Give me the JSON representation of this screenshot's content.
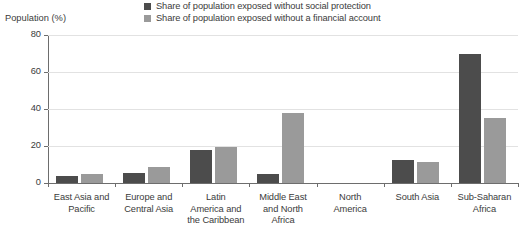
{
  "axis_title": "Population (%)",
  "legend": {
    "items": [
      {
        "label": "Share of population exposed without social protection",
        "color": "#4c4c4c",
        "swatch_name": "legend-swatch-social-protection"
      },
      {
        "label": "Share of population exposed without a financial account",
        "color": "#9a9a9a",
        "swatch_name": "legend-swatch-financial-account"
      }
    ]
  },
  "chart_data": {
    "type": "bar",
    "title": "",
    "subtitle": "",
    "xlabel": "",
    "ylabel": "Population (%)",
    "ylim": [
      0,
      80
    ],
    "yticks": [
      0,
      20,
      40,
      60,
      80
    ],
    "ytick_labels": [
      "0",
      "20",
      "40",
      "60",
      "80"
    ],
    "grid": true,
    "legend_position": "top",
    "categories": [
      "East Asia and Pacific",
      "Europe and Central Asia",
      "Latin America and the Caribbean",
      "Middle East and North Africa",
      "North America",
      "South Asia",
      "Sub-Saharan Africa"
    ],
    "category_lines": [
      [
        "East Asia and",
        "Pacific"
      ],
      [
        "Europe and",
        "Central Asia"
      ],
      [
        "Latin",
        "America and",
        "the Caribbean"
      ],
      [
        "Middle East",
        "and North",
        "Africa"
      ],
      [
        "North",
        "America"
      ],
      [
        "South Asia"
      ],
      [
        "Sub-Saharan",
        "Africa"
      ]
    ],
    "series": [
      {
        "name": "Share of population exposed without social protection",
        "color": "#4c4c4c",
        "values": [
          4,
          5.5,
          18,
          5,
          0,
          12.5,
          70
        ]
      },
      {
        "name": "Share of population exposed without a financial account",
        "color": "#9a9a9a",
        "values": [
          5,
          8.5,
          19.5,
          38,
          0,
          11.5,
          35
        ]
      }
    ]
  }
}
